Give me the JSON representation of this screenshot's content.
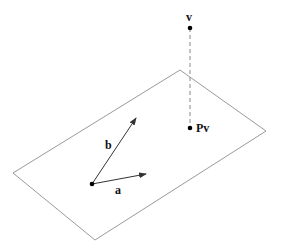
{
  "diagram": {
    "colors": {
      "plane": "#9a9a9a",
      "vector": "#333333",
      "dashed": "#888888",
      "point": "#000000",
      "text": "#111111"
    },
    "plane": {
      "points": [
        [
          180,
          70
        ],
        [
          266,
          131
        ],
        [
          95,
          240
        ],
        [
          13,
          173
        ]
      ]
    },
    "origin": {
      "x": 92,
      "y": 184
    },
    "vectors": [
      {
        "id": "a",
        "label": "a",
        "tip": {
          "x": 146,
          "y": 174
        },
        "label_pos": {
          "x": 115,
          "y": 184
        }
      },
      {
        "id": "b",
        "label": "b",
        "tip": {
          "x": 136,
          "y": 118
        },
        "label_pos": {
          "x": 105,
          "y": 139
        }
      }
    ],
    "point_v": {
      "label": "v",
      "x": 190,
      "y": 28,
      "label_pos": {
        "x": 186,
        "y": 11
      }
    },
    "point_pv": {
      "label": "Pv",
      "x": 190,
      "y": 128,
      "label_pos": {
        "x": 196,
        "y": 122
      }
    }
  }
}
